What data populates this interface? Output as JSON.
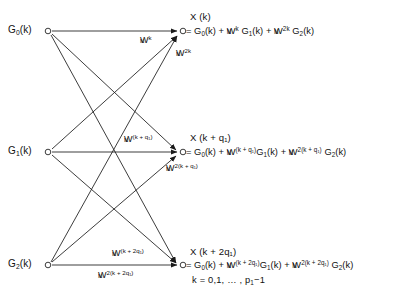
{
  "diagram": {
    "title_semantic": "three-point-fft-butterfly-signal-flow-graph",
    "inputs": [
      {
        "label": "G",
        "sub": "0",
        "arg": "(k)",
        "name": "input-node-g0"
      },
      {
        "label": "G",
        "sub": "1",
        "arg": "(k)",
        "name": "input-node-g1"
      },
      {
        "label": "G",
        "sub": "2",
        "arg": "(k)",
        "name": "input-node-g2"
      }
    ],
    "outputs": [
      {
        "name_text": "X (k)",
        "equation_plain": "= G0(k) + WN^k G1(k) + WN^2k G2(k)",
        "eq_lhs": "= G",
        "eq_lhs_sub": "0",
        "eq_lhs_arg": "(k) +",
        "term1_w": "W",
        "term1_sub": "N",
        "term1_sup": "k",
        "term1_g": "G",
        "term1_g_sub": "1",
        "term1_g_arg": "(k) +",
        "term2_w": "W",
        "term2_sub": "N",
        "term2_sup": "2k",
        "term2_g": "G",
        "term2_g_sub": "2",
        "term2_g_arg": "(k)"
      },
      {
        "name_text": "X (k + q₁)",
        "equation_plain": "= G0(k) + WN^(k+q1) G1(k) + WN^2(k+q1) G2(k)",
        "eq_lhs": "= G",
        "eq_lhs_sub": "0",
        "eq_lhs_arg": "(k) +",
        "term1_w": "W",
        "term1_sub": "N",
        "term1_sup": "(k + q₁)",
        "term1_g": "G",
        "term1_g_sub": "1",
        "term1_g_arg": "(k) +",
        "term2_w": "W",
        "term2_sub": "N",
        "term2_sup": "2(k + q₁)",
        "term2_g": "G",
        "term2_g_sub": "2",
        "term2_g_arg": "(k)"
      },
      {
        "name_text": "X (k + 2q₁)",
        "equation_plain": "= G0(k) + WN^(k+2q1) G1(k) + WN^2(k+2q1) G2(k)",
        "eq_lhs": "= G",
        "eq_lhs_sub": "0",
        "eq_lhs_arg": "(k) +",
        "term1_w": "W",
        "term1_sub": "N",
        "term1_sup": "(k + 2q₁)",
        "term1_g": "G",
        "term1_g_sub": "1",
        "term1_g_arg": "(k) +",
        "term2_w": "W",
        "term2_sub": "N",
        "term2_sup": "2(k + 2q₁)",
        "term2_g": "G",
        "term2_g_sub": "2",
        "term2_g_arg": "(k)"
      }
    ],
    "twiddles": [
      {
        "name": "twiddle-row0-upper",
        "w": "W",
        "sub": "N",
        "sup": "k"
      },
      {
        "name": "twiddle-row0-lower",
        "w": "W",
        "sub": "N",
        "sup": "2k"
      },
      {
        "name": "twiddle-row1-upper",
        "w": "W",
        "sub": "N",
        "sup": "(k + q₁)"
      },
      {
        "name": "twiddle-row1-lower",
        "w": "W",
        "sub": "N",
        "sup": "2(k + q₁)"
      },
      {
        "name": "twiddle-row2-upper",
        "w": "W",
        "sub": "N",
        "sup": "(k + 2q₁)"
      },
      {
        "name": "twiddle-row2-lower",
        "w": "W",
        "sub": "N",
        "sup": "2(k + 2q₁)"
      }
    ],
    "k_range": {
      "prefix": "k = 0,1, … , p",
      "sub": "1",
      "suffix": "−1"
    },
    "colors": {
      "line": "#1a1a1a",
      "text": "#111111",
      "background": "#ffffff"
    },
    "geometry": {
      "left_x": 48,
      "right_x": 183,
      "rows_y": [
        31,
        152,
        265
      ],
      "node_radius": 3
    }
  }
}
